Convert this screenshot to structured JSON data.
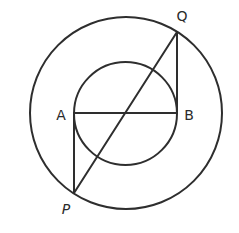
{
  "diagram": {
    "type": "geometry-concentric-circles",
    "canvas": {
      "width": 239,
      "height": 233,
      "background": "#ffffff"
    },
    "stroke_color": "#2e2e2e",
    "outer_circle": {
      "cx": 126,
      "cy": 113,
      "r": 96
    },
    "inner_circle": {
      "cx": 125.5,
      "cy": 113.5,
      "r": 51.5
    },
    "points": {
      "A": {
        "label": "A",
        "x": 74,
        "y": 113,
        "label_x": 61,
        "label_y": 115
      },
      "B": {
        "label": "B",
        "x": 177,
        "y": 113,
        "label_x": 189,
        "label_y": 115
      },
      "P": {
        "label": "P",
        "x": 74,
        "y": 193,
        "label_x": 66,
        "label_y": 209
      },
      "Q": {
        "label": "Q",
        "x": 177,
        "y": 32,
        "label_x": 182,
        "label_y": 16
      }
    },
    "segments": [
      {
        "name": "AB",
        "from": "A",
        "to": "B",
        "description": "diameter of inner circle"
      },
      {
        "name": "AP",
        "from": "A",
        "to": "P",
        "description": "tangent to inner circle at A"
      },
      {
        "name": "BQ",
        "from": "B",
        "to": "Q",
        "description": "tangent to inner circle at B"
      },
      {
        "name": "PQ",
        "from": "P",
        "to": "Q",
        "description": "chord of outer circle through common center"
      }
    ]
  }
}
